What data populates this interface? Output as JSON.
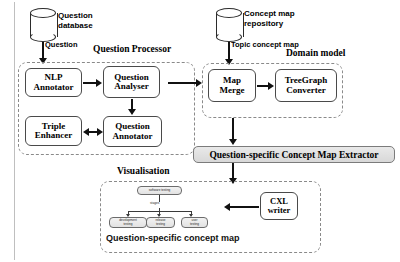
{
  "datastores": [
    {
      "id": "question-database",
      "label_line1": "Question",
      "label_line2": "database"
    },
    {
      "id": "concept-map-repository",
      "label_line1": "Concept map",
      "label_line2": "repository"
    }
  ],
  "edge_labels": {
    "question": "Question",
    "topic_concept_map": "Topic concept map"
  },
  "groups": {
    "question_processor": {
      "caption": "Question Processor"
    },
    "domain_model": {
      "caption": "Domain model"
    },
    "visualisation": {
      "caption": "Visualisation"
    }
  },
  "modules": {
    "nlp_annotator": {
      "line1": "NLP",
      "line2": "Annotator"
    },
    "question_analyser": {
      "line1": "Question",
      "line2": "Analyser"
    },
    "triple_enhancer": {
      "line1": "Triple",
      "line2": "Enhancer"
    },
    "question_annotator": {
      "line1": "Question",
      "line2": "Annotator"
    },
    "map_merge": {
      "line1": "Map",
      "line2": "Merge"
    },
    "treegraph_converter": {
      "line1": "TreeGraph",
      "line2": "Converter"
    },
    "cxl_writer": {
      "line1": "CXL",
      "line2": "writer"
    }
  },
  "extractor_bar": {
    "label": "Question-specific Concept Map Extractor"
  },
  "concept_map": {
    "caption": "Question-specific concept map",
    "root": "software testing",
    "relation": "stages",
    "leaves": [
      {
        "line1": "development",
        "line2": "testing"
      },
      {
        "line1": "release",
        "line2": "testing"
      },
      {
        "line1": "user",
        "line2": "testing"
      }
    ]
  },
  "colors": {
    "ink": "#000000",
    "box_stroke": "#4a4a4a",
    "dashed_stroke": "#8a8a8a",
    "grey_bar_fill": "#e3e3e3",
    "node_fill": "#ebebeb",
    "background": "#ffffff"
  }
}
